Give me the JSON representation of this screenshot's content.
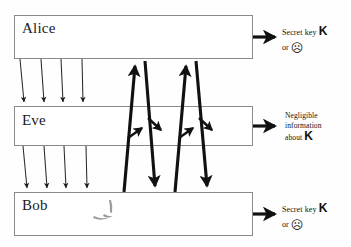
{
  "diagram": {
    "background_color": "#fefefe",
    "stroke_color": "#111111",
    "box_border_color": "#8a8a8a",
    "parties": [
      {
        "id": "alice",
        "label": "Alice"
      },
      {
        "id": "eve",
        "label": "Eve"
      },
      {
        "id": "bob",
        "label": "Bob"
      }
    ],
    "outcomes": [
      {
        "id": "alice-outcome",
        "line1": "Secret key",
        "key_symbol": "K",
        "or_word": "or",
        "face": "☹"
      },
      {
        "id": "eve-outcome",
        "line1": "Negligible",
        "line2": "information",
        "line3": "about",
        "key_symbol": "K"
      },
      {
        "id": "bob-outcome",
        "line1": "Secret key",
        "key_symbol": "K",
        "or_word": "or",
        "face": "☹"
      }
    ]
  }
}
